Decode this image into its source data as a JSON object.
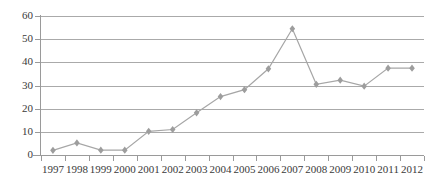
{
  "chart_data": {
    "type": "line",
    "title": "",
    "subtitle": "",
    "xlabel": "",
    "ylabel": "",
    "categories": [
      "1997",
      "1998",
      "1999",
      "2000",
      "2001",
      "2002",
      "2003",
      "2004",
      "2005",
      "2006",
      "2007",
      "2008",
      "2009",
      "2010",
      "2011",
      "2012"
    ],
    "series": [
      {
        "name": "Series 1",
        "values": [
          2.0,
          5.2,
          2.1,
          2.1,
          10.2,
          11.0,
          18.2,
          25.2,
          28.2,
          37.2,
          54.5,
          30.5,
          32.3,
          29.7,
          37.5,
          37.5
        ]
      }
    ],
    "ylim": [
      0,
      60
    ],
    "yticks": [
      0,
      10,
      20,
      30,
      40,
      50,
      60
    ],
    "ytick_labels": [
      "0",
      "10",
      "20",
      "30",
      "40",
      "50",
      "60"
    ],
    "grid": "horizontal",
    "legend": "none",
    "marker": "diamond",
    "colors": {
      "line": "#a6a6a6",
      "marker": "#9d9d9d",
      "gridline": "#aaaaaa",
      "axis": "#9a9a9a",
      "text": "#3a3a3a",
      "background": "#ffffff"
    }
  }
}
